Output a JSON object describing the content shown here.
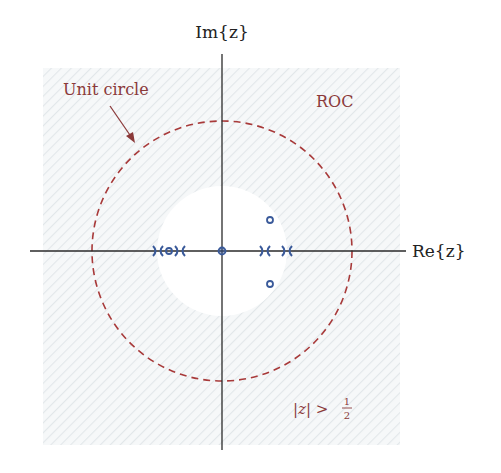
{
  "diagram": {
    "type": "pole-zero plot",
    "axes": {
      "x_label": "Re{z}",
      "y_label": "Im{z}"
    },
    "labels": {
      "unit_circle": "Unit circle",
      "roc": "ROC",
      "roc_condition": "|z| > 1/2",
      "roc_condition_lhs": "|z| >",
      "roc_condition_num": "1",
      "roc_condition_den": "2"
    },
    "colors": {
      "axis": "#222222",
      "unit_circle": "#a03030",
      "annotation_text": "#8b3a3a",
      "markers": "#3a5a9a",
      "roc_hatch": "#e6ebee"
    },
    "geometry": {
      "origin_px": [
        222,
        251
      ],
      "unit_radius_px": 130,
      "roc_inner_radius": 0.5
    },
    "poles": [
      {
        "re": -0.5,
        "im": 0
      },
      {
        "re": -0.32,
        "im": 0
      },
      {
        "re": 0.33,
        "im": 0
      },
      {
        "re": 0.51,
        "im": 0
      }
    ],
    "zeros": [
      {
        "re": -0.41,
        "im": 0
      },
      {
        "re": 0,
        "im": 0
      },
      {
        "re": 0.37,
        "im": 0.24
      },
      {
        "re": 0.37,
        "im": -0.24
      }
    ]
  }
}
